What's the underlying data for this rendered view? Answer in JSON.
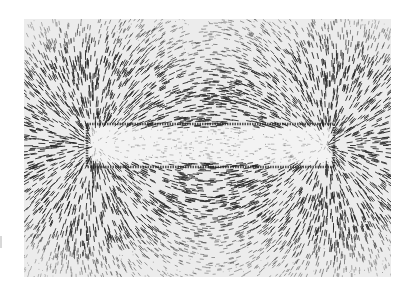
{
  "image": {
    "subject": "Iron filings aligned along magnetic field lines around a bar magnet",
    "background_color": "#ececec",
    "filings_color": "#2a2a2a",
    "magnet": {
      "outline_color": "#1e1e1e",
      "interior_color": "#f6f6f6",
      "x": 63,
      "y": 105,
      "width": 247,
      "height": 43
    }
  }
}
